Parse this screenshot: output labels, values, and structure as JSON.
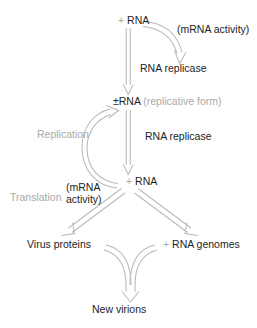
{
  "figure": {
    "type": "flowchart",
    "background_color": "#ffffff",
    "arrow_color": "#b3b3b3",
    "text_color_primary": "#1d1d1d",
    "text_color_secondary": "#a9a9a9"
  },
  "nodes": {
    "plus_rna_top": {
      "plus": "+",
      "label": "RNA"
    },
    "pm_rna": {
      "symbol": "±",
      "label": "RNA",
      "qualifier": "(replicative form)"
    },
    "plus_rna_mid": {
      "plus": "+",
      "label": "RNA"
    },
    "virus_proteins": {
      "label": "Virus proteins"
    },
    "rna_genomes": {
      "plus": "+",
      "label": "RNA genomes"
    },
    "new_virions": {
      "label": "New virions"
    }
  },
  "annotations": {
    "mrna_activity_top": "(mRNA activity)",
    "rna_replicase_1": "RNA replicase",
    "rna_replicase_2": "RNA replicase",
    "replication": "Replication",
    "translation": "Translation",
    "mrna_activity_line1": "(mRNA",
    "mrna_activity_line2": "activity)"
  },
  "edges": [
    {
      "name": "plus-rna-to-pm-rna",
      "from": "plus_rna_top",
      "to": "pm_rna",
      "style": "straight-vertical-outline-arrow",
      "label": "rna_replicase_1"
    },
    {
      "name": "mrna-activity-curve",
      "from": "plus_rna_top",
      "to": "rna_replicase_1",
      "style": "curved-outline-arrow",
      "label": "mrna_activity_top"
    },
    {
      "name": "pm-rna-to-plus-rna",
      "from": "pm_rna",
      "to": "plus_rna_mid",
      "style": "straight-vertical-outline-arrow",
      "label": "rna_replicase_2"
    },
    {
      "name": "replication-loop",
      "from": "plus_rna_mid",
      "to": "pm_rna",
      "style": "curved-outline-arrow-left",
      "label": "replication"
    },
    {
      "name": "plus-rna-to-virus-proteins",
      "from": "plus_rna_mid",
      "to": "virus_proteins",
      "style": "diagonal-outline-arrow",
      "label": "translation"
    },
    {
      "name": "plus-rna-to-rna-genomes",
      "from": "plus_rna_mid",
      "to": "rna_genomes",
      "style": "diagonal-outline-arrow"
    },
    {
      "name": "virus-proteins-to-new-virions",
      "from": "virus_proteins",
      "to": "new_virions",
      "style": "curved-outline-arrow"
    },
    {
      "name": "rna-genomes-to-new-virions",
      "from": "rna_genomes",
      "to": "new_virions",
      "style": "curved-outline-arrow"
    }
  ]
}
